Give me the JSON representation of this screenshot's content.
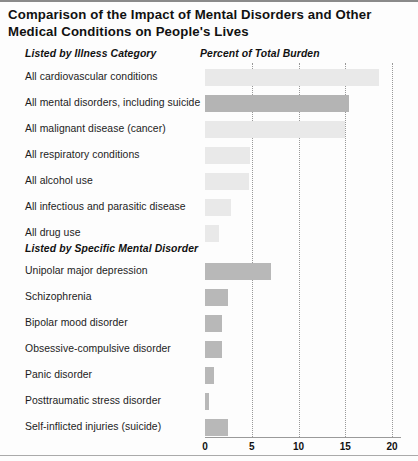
{
  "title": "Comparison of the Impact of Mental Disorders and Other Medical Conditions on People's Lives",
  "headers": {
    "category": "Listed by Illness Category",
    "specific": "Listed by Specific Mental Disorder",
    "value_axis": "Percent of Total Burden"
  },
  "chart_data": {
    "type": "bar",
    "title": "Comparison of the Impact of Mental Disorders and Other Medical Conditions on People's Lives",
    "orientation": "horizontal",
    "xlabel": "Percent of Total Burden",
    "ylabel": "",
    "xlim": [
      0,
      20
    ],
    "xticks": [
      0,
      5,
      10,
      15,
      20
    ],
    "xtick_labels": [
      "0",
      "5",
      "10",
      "15",
      "20"
    ],
    "grid": "vertical-dotted",
    "legend": "none",
    "groups": [
      {
        "name": "Listed by Illness Category",
        "categories": [
          "All cardiovascular conditions",
          "All mental disorders, including suicide",
          "All malignant disease (cancer)",
          "All respiratory conditions",
          "All alcohol use",
          "All  infectious and parasitic disease",
          "All drug use"
        ],
        "values": [
          18.6,
          15.4,
          15.0,
          4.8,
          4.7,
          2.8,
          1.5
        ],
        "colors": [
          "#e9e9e9",
          "#b4b4b4",
          "#e9e9e9",
          "#e9e9e9",
          "#e9e9e9",
          "#e9e9e9",
          "#e9e9e9"
        ]
      },
      {
        "name": "Listed by Specific Mental Disorder",
        "categories": [
          "Unipolar major depression",
          "Schizophrenia",
          "Bipolar mood disorder",
          "Obsessive-compulsive disorder",
          "Panic disorder",
          "Posttraumatic stress disorder",
          "Self-inflicted injuries (suicide)"
        ],
        "values": [
          7.1,
          2.5,
          1.8,
          1.8,
          1.0,
          0.4,
          2.5
        ],
        "colors": [
          "#b8b8b8",
          "#b8b8b8",
          "#b8b8b8",
          "#b8b8b8",
          "#b8b8b8",
          "#b8b8b8",
          "#b8b8b8"
        ]
      }
    ]
  }
}
